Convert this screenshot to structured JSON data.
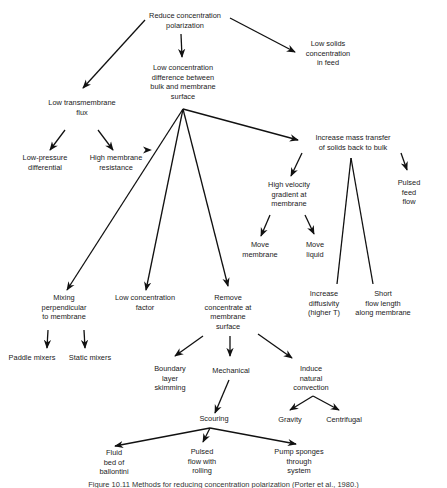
{
  "diagram": {
    "title": "Reduce concentration polarization",
    "nodes": {
      "root": "Reduce concentration\npolarization",
      "low_diff": "Low concentration\ndifference between\nbulk and membrane\nsurface",
      "low_solids": "Low solids\nconcentration\nin feed",
      "low_flux": "Low transmembrane\nflux",
      "low_pressure": "Low-pressure\ndifferential",
      "high_resistance": "High membrane\nresistance",
      "increase_mass": "Increase mass transfer\nof solids back to bulk",
      "high_velocity": "High velocity\ngradient at\nmembrane",
      "pulsed_feed": "Pulsed feed\nflow",
      "move_membrane": "Move\nmembrane",
      "move_liquid": "Move\nliquid",
      "mixing": "Mixing\nperpendicular\nto membrane",
      "low_conc_factor": "Low concentration\nfactor",
      "remove_conc": "Remove\nconcentrate at\nmembrane\nsurface",
      "increase_diff": "Increase\ndiffusivity\n(higher T)",
      "short_flow": "Short\nflow length\nalong membrane",
      "paddle": "Paddle mixers",
      "static": "Static mixers",
      "boundary": "Boundary\nlayer\nskimming",
      "mechanical": "Mechanical",
      "natural_conv": "Induce\nnatural\nconvection",
      "scouring": "Scouring",
      "gravity": "Gravity",
      "centrifugal": "Centrifugal",
      "fluid_bed": "Fluid\nbed of\nballontini",
      "pulsed_rolling": "Pulsed\nflow with\nrolling",
      "pump_sponges": "Pump sponges\nthrough\nsystem"
    },
    "edges": [
      [
        "root",
        "low_diff"
      ],
      [
        "root",
        "low_solids"
      ],
      [
        "root",
        "low_flux"
      ],
      [
        "low_flux",
        "low_pressure"
      ],
      [
        "low_flux",
        "high_resistance"
      ],
      [
        "low_diff",
        "increase_mass"
      ],
      [
        "low_diff",
        "mixing"
      ],
      [
        "low_diff",
        "low_conc_factor"
      ],
      [
        "low_diff",
        "remove_conc"
      ],
      [
        "increase_mass",
        "high_velocity"
      ],
      [
        "increase_mass",
        "pulsed_feed"
      ],
      [
        "increase_mass",
        "increase_diff"
      ],
      [
        "increase_mass",
        "short_flow"
      ],
      [
        "high_velocity",
        "move_membrane"
      ],
      [
        "high_velocity",
        "move_liquid"
      ],
      [
        "mixing",
        "paddle"
      ],
      [
        "mixing",
        "static"
      ],
      [
        "remove_conc",
        "boundary"
      ],
      [
        "remove_conc",
        "mechanical"
      ],
      [
        "remove_conc",
        "natural_conv"
      ],
      [
        "mechanical",
        "scouring"
      ],
      [
        "natural_conv",
        "gravity"
      ],
      [
        "natural_conv",
        "centrifugal"
      ],
      [
        "scouring",
        "fluid_bed"
      ],
      [
        "scouring",
        "pulsed_rolling"
      ],
      [
        "scouring",
        "pump_sponges"
      ]
    ],
    "caption": "Figure 10.11 Methods for reducing concentration polarization (Porter et al., 1980.)"
  }
}
